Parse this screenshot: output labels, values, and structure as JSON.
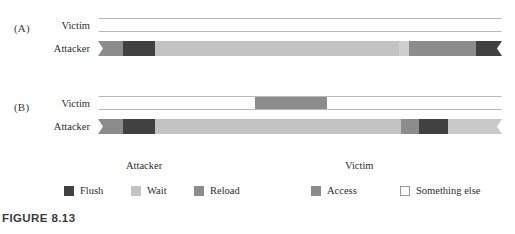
{
  "figure": {
    "caption": "FIGURE 8.13",
    "panels": [
      {
        "id": "A",
        "label": "(A)",
        "rows": [
          {
            "name": "victim",
            "label": "Victim",
            "segments": [
              {
                "state": "Something else",
                "color": "#ffffff",
                "start_pct": 0,
                "width_pct": 100
              }
            ]
          },
          {
            "name": "attacker",
            "label": "Attacker",
            "segments": [
              {
                "state": "Reload",
                "color": "#8c8c8c",
                "start_pct": 0,
                "width_pct": 6.2
              },
              {
                "state": "Flush",
                "color": "#414141",
                "start_pct": 6.2,
                "width_pct": 7.9
              },
              {
                "state": "Wait",
                "color": "#c3c3c3",
                "start_pct": 14.1,
                "width_pct": 60.4
              },
              {
                "state": "Wait",
                "color": "#cfcfcf",
                "start_pct": 74.5,
                "width_pct": 2.5
              },
              {
                "state": "Reload",
                "color": "#8c8c8c",
                "start_pct": 77.0,
                "width_pct": 16.5
              },
              {
                "state": "Flush",
                "color": "#414141",
                "start_pct": 93.5,
                "width_pct": 6.5
              }
            ]
          }
        ]
      },
      {
        "id": "B",
        "label": "(B)",
        "rows": [
          {
            "name": "victim",
            "label": "Victim",
            "segments": [
              {
                "state": "Something else",
                "color": "#ffffff",
                "start_pct": 0,
                "width_pct": 38.9
              },
              {
                "state": "Access",
                "color": "#8c8c8c",
                "start_pct": 38.9,
                "width_pct": 17.8
              },
              {
                "state": "Something else",
                "color": "#ffffff",
                "start_pct": 56.7,
                "width_pct": 43.3
              }
            ]
          },
          {
            "name": "attacker",
            "label": "Attacker",
            "segments": [
              {
                "state": "Reload",
                "color": "#8c8c8c",
                "start_pct": 0,
                "width_pct": 6.2
              },
              {
                "state": "Flush",
                "color": "#414141",
                "start_pct": 6.2,
                "width_pct": 7.9
              },
              {
                "state": "Wait",
                "color": "#c3c3c3",
                "start_pct": 14.1,
                "width_pct": 60.9
              },
              {
                "state": "Reload",
                "color": "#8c8c8c",
                "start_pct": 75.0,
                "width_pct": 4.5
              },
              {
                "state": "Flush",
                "color": "#414141",
                "start_pct": 79.5,
                "width_pct": 7.2
              },
              {
                "state": "Wait",
                "color": "#c9c9c9",
                "start_pct": 86.7,
                "width_pct": 13.3
              }
            ]
          }
        ]
      }
    ],
    "legend": {
      "groups": [
        {
          "title": "Attacker",
          "items": [
            {
              "label": "Flush",
              "color": "#414141",
              "outline": false
            },
            {
              "label": "Wait",
              "color": "#c3c3c3",
              "outline": false
            },
            {
              "label": "Reload",
              "color": "#8c8c8c",
              "outline": false
            }
          ]
        },
        {
          "title": "Victim",
          "items": [
            {
              "label": "Access",
              "color": "#8c8c8c",
              "outline": false
            },
            {
              "label": "Something else",
              "color": "#ffffff",
              "outline": true
            }
          ]
        }
      ]
    }
  },
  "chart_data": {
    "type": "bar",
    "title": "FIGURE 8.13",
    "xlabel": "time",
    "ylabel": "",
    "grid": false,
    "legend_position": "bottom",
    "categories": [
      "(A) Victim",
      "(A) Attacker",
      "(B) Victim",
      "(B) Attacker"
    ],
    "series": [
      {
        "name": "(A) Victim",
        "timeline": [
          {
            "state": "Something else",
            "start_pct": 0,
            "end_pct": 100
          }
        ]
      },
      {
        "name": "(A) Attacker",
        "timeline": [
          {
            "state": "Reload",
            "start_pct": 0,
            "end_pct": 6.2
          },
          {
            "state": "Flush",
            "start_pct": 6.2,
            "end_pct": 14.1
          },
          {
            "state": "Wait",
            "start_pct": 14.1,
            "end_pct": 77.0
          },
          {
            "state": "Reload",
            "start_pct": 77.0,
            "end_pct": 93.5
          },
          {
            "state": "Flush",
            "start_pct": 93.5,
            "end_pct": 100
          }
        ]
      },
      {
        "name": "(B) Victim",
        "timeline": [
          {
            "state": "Something else",
            "start_pct": 0,
            "end_pct": 38.9
          },
          {
            "state": "Access",
            "start_pct": 38.9,
            "end_pct": 56.7
          },
          {
            "state": "Something else",
            "start_pct": 56.7,
            "end_pct": 100
          }
        ]
      },
      {
        "name": "(B) Attacker",
        "timeline": [
          {
            "state": "Reload",
            "start_pct": 0,
            "end_pct": 6.2
          },
          {
            "state": "Flush",
            "start_pct": 6.2,
            "end_pct": 14.1
          },
          {
            "state": "Wait",
            "start_pct": 14.1,
            "end_pct": 75.0
          },
          {
            "state": "Reload",
            "start_pct": 75.0,
            "end_pct": 79.5
          },
          {
            "state": "Flush",
            "start_pct": 79.5,
            "end_pct": 86.7
          },
          {
            "state": "Wait",
            "start_pct": 86.7,
            "end_pct": 100
          }
        ]
      }
    ],
    "state_colors": {
      "Flush": "#414141",
      "Wait": "#c3c3c3",
      "Reload": "#8c8c8c",
      "Access": "#8c8c8c",
      "Something else": "#ffffff"
    }
  }
}
